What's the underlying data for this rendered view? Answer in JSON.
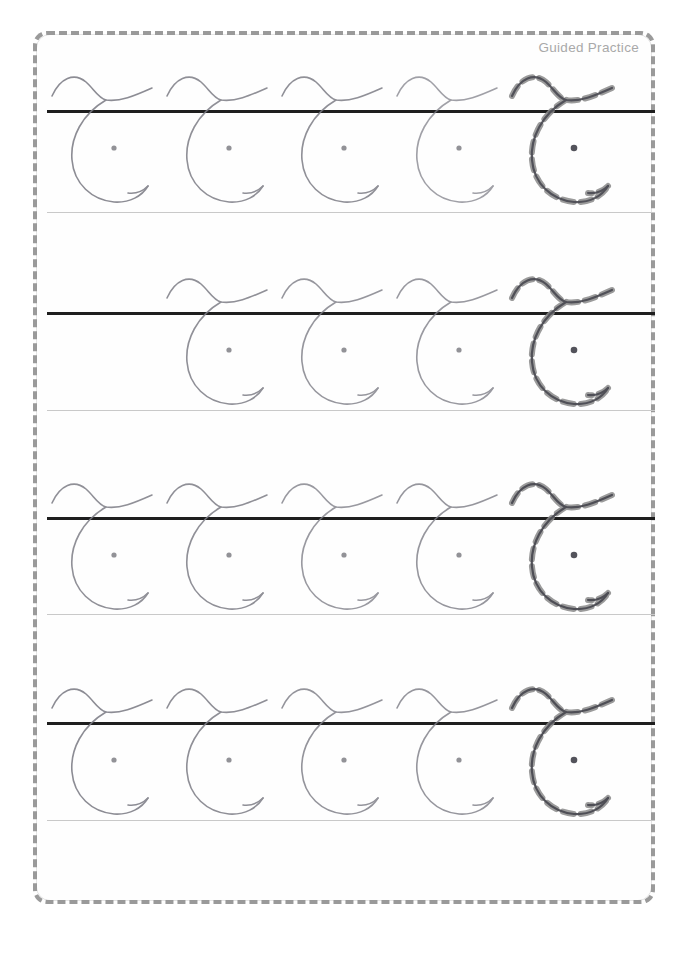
{
  "page": {
    "title": "Guided Practice",
    "letter": "C",
    "script_style": "cursive-uppercase",
    "background_color": "#ffffff",
    "border_color": "#9a9a9a",
    "header_text_color": "#a9a9a9"
  },
  "guides": {
    "midline_color": "#1e1e1e",
    "midline_thickness_px": 3,
    "baseline_color": "#c9c9c9",
    "baseline_thickness_px": 1,
    "line_left_px": 47,
    "line_width_px": 608
  },
  "strokes": {
    "handwriting_color": "#4a4a52",
    "handwriting_color_light": "#7d7d86",
    "trace_guide_color": "#8a8a8a",
    "dot_color": "#4a4a52"
  },
  "rows": [
    {
      "index": 1,
      "midline_y": 110,
      "baseline_y": 212,
      "letters": [
        {
          "slot": 1,
          "x": 48,
          "present": true,
          "traced": false,
          "opacity": 0.88,
          "dot": true
        },
        {
          "slot": 2,
          "x": 163,
          "present": true,
          "traced": false,
          "opacity": 0.85,
          "dot": true
        },
        {
          "slot": 3,
          "x": 278,
          "present": true,
          "traced": false,
          "opacity": 0.85,
          "dot": true
        },
        {
          "slot": 4,
          "x": 393,
          "present": true,
          "traced": false,
          "opacity": 0.72,
          "dot": true
        },
        {
          "slot": 5,
          "x": 508,
          "present": true,
          "traced": true,
          "opacity": 0.9,
          "dot": true
        }
      ]
    },
    {
      "index": 2,
      "midline_y": 312,
      "baseline_y": 410,
      "letters": [
        {
          "slot": 1,
          "x": 48,
          "present": false,
          "traced": false,
          "opacity": 0,
          "dot": false
        },
        {
          "slot": 2,
          "x": 163,
          "present": true,
          "traced": false,
          "opacity": 0.85,
          "dot": true
        },
        {
          "slot": 3,
          "x": 278,
          "present": true,
          "traced": false,
          "opacity": 0.8,
          "dot": true
        },
        {
          "slot": 4,
          "x": 393,
          "present": true,
          "traced": false,
          "opacity": 0.78,
          "dot": true
        },
        {
          "slot": 5,
          "x": 508,
          "present": true,
          "traced": true,
          "opacity": 0.92,
          "dot": true
        }
      ]
    },
    {
      "index": 3,
      "midline_y": 517,
      "baseline_y": 614,
      "letters": [
        {
          "slot": 1,
          "x": 48,
          "present": true,
          "traced": false,
          "opacity": 0.85,
          "dot": true
        },
        {
          "slot": 2,
          "x": 163,
          "present": true,
          "traced": false,
          "opacity": 0.85,
          "dot": true
        },
        {
          "slot": 3,
          "x": 278,
          "present": true,
          "traced": false,
          "opacity": 0.78,
          "dot": true
        },
        {
          "slot": 4,
          "x": 393,
          "present": true,
          "traced": false,
          "opacity": 0.8,
          "dot": true
        },
        {
          "slot": 5,
          "x": 508,
          "present": true,
          "traced": true,
          "opacity": 0.95,
          "dot": true
        }
      ]
    },
    {
      "index": 4,
      "midline_y": 722,
      "baseline_y": 820,
      "letters": [
        {
          "slot": 1,
          "x": 48,
          "present": true,
          "traced": false,
          "opacity": 0.88,
          "dot": true
        },
        {
          "slot": 2,
          "x": 163,
          "present": true,
          "traced": false,
          "opacity": 0.86,
          "dot": true
        },
        {
          "slot": 3,
          "x": 278,
          "present": true,
          "traced": false,
          "opacity": 0.82,
          "dot": true
        },
        {
          "slot": 4,
          "x": 393,
          "present": true,
          "traced": false,
          "opacity": 0.8,
          "dot": true
        },
        {
          "slot": 5,
          "x": 508,
          "present": true,
          "traced": true,
          "opacity": 0.95,
          "dot": true
        }
      ]
    }
  ],
  "letter_geometry": {
    "viewbox": "0 0 130 160",
    "entry_flourish_path": "M 4 44 C 12 26 26 20 38 30 C 46 37 50 46 58 48 C 72 50 86 44 104 36",
    "bowl_path": "M 58 48 C 34 62 22 86 24 108 C 26 132 44 148 66 150 C 82 151 94 144 100 134",
    "tail_path": "M 100 134 C 95 139 88 142 80 141",
    "dot_cx": 66,
    "dot_cy": 96,
    "dot_r": 2.6,
    "dash_pattern": "11 7"
  }
}
